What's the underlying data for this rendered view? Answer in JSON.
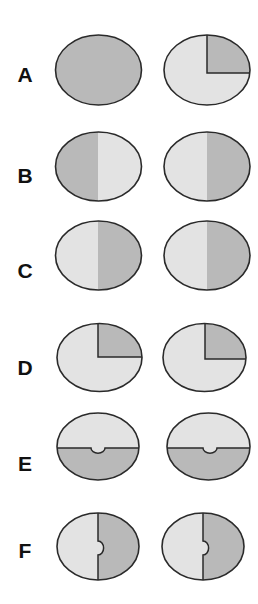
{
  "colors": {
    "light": "#e3e3e3",
    "dark": "#b9b9b9",
    "stroke": "#2a2a2a",
    "background": "#ffffff"
  },
  "rows": [
    {
      "label": "A",
      "label_y": 82,
      "cy": 70,
      "ry": 35,
      "pair": [
        {
          "cx": 98.5,
          "rx": 43,
          "pattern": "solid-dark"
        },
        {
          "cx": 207,
          "rx": 43,
          "pattern": "quadrant-upper-right-dark",
          "split_x": 207,
          "split_y": 73
        }
      ]
    },
    {
      "label": "B",
      "label_y": 183,
      "cy": 166.5,
      "ry": 34.5,
      "pair": [
        {
          "cx": 98.5,
          "rx": 43,
          "pattern": "left-dark-right-light",
          "split_x": 98
        },
        {
          "cx": 207,
          "rx": 43,
          "pattern": "left-light-right-dark",
          "split_x": 207
        }
      ]
    },
    {
      "label": "C",
      "label_y": 278,
      "cy": 255.5,
      "ry": 34.5,
      "pair": [
        {
          "cx": 98.5,
          "rx": 43,
          "pattern": "left-light-right-dark",
          "split_x": 98
        },
        {
          "cx": 207,
          "rx": 43,
          "pattern": "left-light-right-dark",
          "split_x": 207
        }
      ]
    },
    {
      "label": "D",
      "label_y": 375,
      "cy": 357.5,
      "ry": 34,
      "pair": [
        {
          "cx": 99.5,
          "rx": 42.5,
          "pattern": "quadrant-upper-right-dark",
          "split_x": 98,
          "split_y": 357
        },
        {
          "cx": 204.5,
          "rx": 41.5,
          "pattern": "quadrant-upper-right-dark",
          "split_x": 205,
          "split_y": 359
        }
      ]
    },
    {
      "label": "E",
      "label_y": 471,
      "cy": 446.5,
      "ry": 33.5,
      "pair": [
        {
          "cx": 98,
          "rx": 41,
          "pattern": "top-light-bottom-dark-with-notch",
          "split_y": 448,
          "notch_x": 98,
          "notch_r": 7
        },
        {
          "cx": 208.5,
          "rx": 41.5,
          "pattern": "top-light-bottom-dark-with-notch",
          "split_y": 448,
          "notch_x": 210,
          "notch_r": 7
        }
      ]
    },
    {
      "label": "F",
      "label_y": 558,
      "cy": 546.5,
      "ry": 33.5,
      "pair": [
        {
          "cx": 98,
          "rx": 41,
          "pattern": "left-light-right-dark-with-notch",
          "split_x": 98,
          "notch_y": 548,
          "notch_r": 7
        },
        {
          "cx": 203,
          "rx": 41,
          "pattern": "left-light-right-dark-with-notch",
          "split_x": 203,
          "notch_y": 548,
          "notch_r": 7
        }
      ]
    }
  ]
}
